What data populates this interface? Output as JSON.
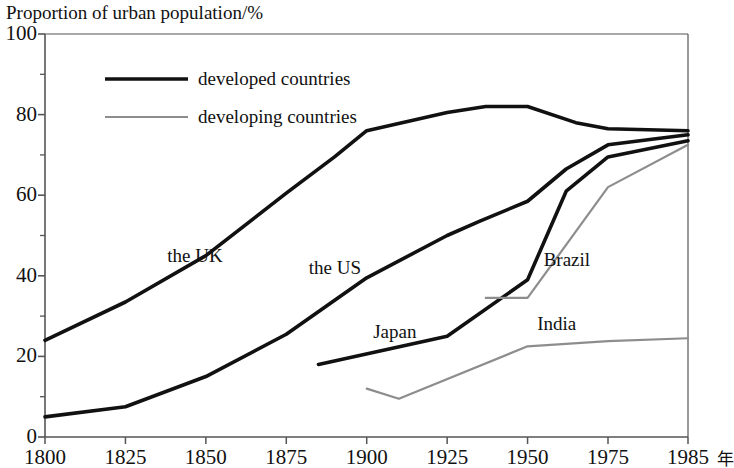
{
  "chart_data": {
    "type": "line",
    "title": "Proportion of urban population/%",
    "xlabel": "",
    "ylabel": "Proportion of urban population/%",
    "x_unit": "年",
    "xlim": [
      1800,
      1985
    ],
    "ylim": [
      0,
      100
    ],
    "grid": false,
    "legend_position": "top-left-inside",
    "y_ticks": [
      0,
      20,
      40,
      60,
      80,
      100
    ],
    "y_tick_labels": [
      "0",
      "20",
      "40",
      "60",
      "80",
      "100"
    ],
    "y_minor_ticks": [
      10,
      30,
      50,
      70,
      90
    ],
    "x_ticks": [
      1800,
      1825,
      1850,
      1875,
      1900,
      1925,
      1950,
      1975,
      1985
    ],
    "x_tick_labels": [
      "1800",
      "1825",
      "1850",
      "1875",
      "1900",
      "1925",
      "1950",
      "1975",
      "1985"
    ],
    "legend": [
      {
        "name": "developed countries",
        "color": "#111111",
        "width": 3.6
      },
      {
        "name": "developing countries",
        "color": "#8d8d8d",
        "width": 2.2
      }
    ],
    "series": [
      {
        "name": "the UK",
        "group": "developed countries",
        "color": "#111111",
        "width": 3.6,
        "label_x": 1838,
        "label_y": 45,
        "points": [
          [
            1800,
            24.0
          ],
          [
            1825,
            33.5
          ],
          [
            1850,
            45.0
          ],
          [
            1875,
            60.5
          ],
          [
            1890,
            69.5
          ],
          [
            1900,
            76.0
          ],
          [
            1925,
            80.5
          ],
          [
            1937,
            82.0
          ],
          [
            1950,
            82.0
          ],
          [
            1965,
            78.0
          ],
          [
            1975,
            76.5
          ],
          [
            1985,
            76.0
          ]
        ]
      },
      {
        "name": "the US",
        "group": "developed countries",
        "color": "#111111",
        "width": 3.6,
        "label_x": 1882,
        "label_y": 42,
        "points": [
          [
            1800,
            5.0
          ],
          [
            1825,
            7.5
          ],
          [
            1850,
            15.0
          ],
          [
            1875,
            25.5
          ],
          [
            1900,
            39.5
          ],
          [
            1925,
            50.0
          ],
          [
            1935,
            53.5
          ],
          [
            1950,
            58.5
          ],
          [
            1962,
            66.5
          ],
          [
            1975,
            72.5
          ],
          [
            1985,
            75.0
          ]
        ]
      },
      {
        "name": "Japan",
        "group": "developed countries",
        "color": "#111111",
        "width": 3.6,
        "label_x": 1902,
        "label_y": 26,
        "points": [
          [
            1885,
            18.0
          ],
          [
            1925,
            25.0
          ],
          [
            1950,
            39.0
          ],
          [
            1962,
            61.0
          ],
          [
            1975,
            69.5
          ],
          [
            1985,
            73.5
          ]
        ]
      },
      {
        "name": "Brazil",
        "group": "developing countries",
        "color": "#8d8d8d",
        "width": 2.2,
        "label_x": 1955,
        "label_y": 44,
        "points": [
          [
            1937,
            34.5
          ],
          [
            1950,
            34.5
          ],
          [
            1975,
            62.0
          ],
          [
            1985,
            72.5
          ]
        ]
      },
      {
        "name": "India",
        "group": "developing countries",
        "color": "#8d8d8d",
        "width": 2.2,
        "label_x": 1953,
        "label_y": 28,
        "points": [
          [
            1900,
            12.0
          ],
          [
            1910,
            9.5
          ],
          [
            1950,
            22.5
          ],
          [
            1975,
            23.8
          ],
          [
            1985,
            24.5
          ]
        ]
      }
    ]
  },
  "plot": {
    "frame_color": "#555555",
    "background": "#ffffff"
  }
}
